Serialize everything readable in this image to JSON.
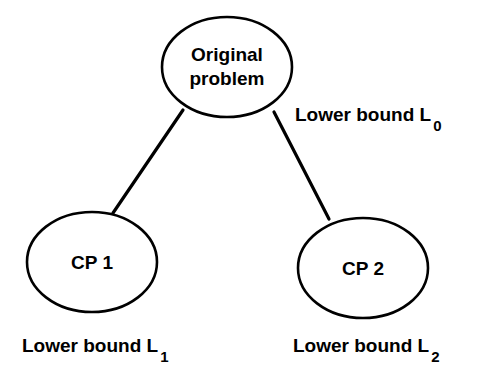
{
  "diagram": {
    "background_color": "#ffffff",
    "stroke_color": "#000000",
    "text_color": "#000000",
    "nodes": [
      {
        "id": "root",
        "name": "original-problem-node",
        "line1": "Original",
        "line2": "problem",
        "cx": 227,
        "cy": 67,
        "rx": 65,
        "ry": 50
      },
      {
        "id": "cp1",
        "name": "cp1-node",
        "line1": "CP  1",
        "line2": "",
        "cx": 92,
        "cy": 262,
        "rx": 65,
        "ry": 50
      },
      {
        "id": "cp2",
        "name": "cp2-node",
        "line1": "CP  2",
        "line2": "",
        "cx": 363,
        "cy": 268,
        "rx": 65,
        "ry": 50
      }
    ],
    "edges": [
      {
        "id": "root-to-cp1",
        "name": "edge-root-to-cp1",
        "x1": 183,
        "y1": 110,
        "x2": 113,
        "y2": 213
      },
      {
        "id": "root-to-cp2",
        "name": "edge-root-to-cp2",
        "x1": 274,
        "y1": 112,
        "x2": 329,
        "y2": 219
      }
    ],
    "labels": [
      {
        "id": "L0",
        "name": "lower-bound-l0-label",
        "text": "Lower bound  L",
        "subscript": "0",
        "x": 295,
        "y": 121
      },
      {
        "id": "L1",
        "name": "lower-bound-l1-label",
        "text": "Lower bound  L",
        "subscript": "1",
        "x": 22,
        "y": 352
      },
      {
        "id": "L2",
        "name": "lower-bound-l2-label",
        "text": "Lower bound  L",
        "subscript": "2",
        "x": 293,
        "y": 352
      }
    ]
  }
}
